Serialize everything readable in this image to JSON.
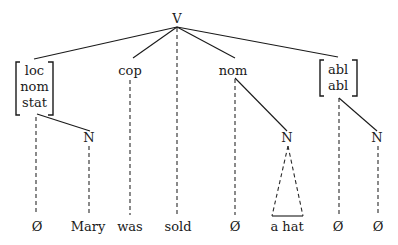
{
  "diagram": {
    "type": "syntax-tree",
    "root": {
      "id": "V",
      "label": "V"
    },
    "nodes": [
      {
        "id": "case1",
        "kind": "feature-bundle",
        "labels": [
          "loc",
          "nom",
          "stat"
        ],
        "parent": "V"
      },
      {
        "id": "cop",
        "kind": "label",
        "labels": [
          "cop"
        ],
        "parent": "V"
      },
      {
        "id": "nom",
        "kind": "label",
        "labels": [
          "nom"
        ],
        "parent": "V"
      },
      {
        "id": "case4",
        "kind": "feature-bundle",
        "labels": [
          "abl",
          "abl"
        ],
        "parent": "V"
      },
      {
        "id": "N1",
        "kind": "label",
        "labels": [
          "N"
        ],
        "parent": "case1"
      },
      {
        "id": "N2",
        "kind": "label",
        "labels": [
          "N"
        ],
        "parent": "nom"
      },
      {
        "id": "N3",
        "kind": "label",
        "labels": [
          "N"
        ],
        "parent": "case4"
      }
    ],
    "terminals": [
      {
        "id": "t1",
        "label": "Ø",
        "parent": "case1",
        "link": "dashed"
      },
      {
        "id": "t2",
        "label": "Mary",
        "parent": "N1",
        "link": "dashed"
      },
      {
        "id": "t3",
        "label": "was",
        "parent": "cop",
        "link": "dashed"
      },
      {
        "id": "t4",
        "label": "sold",
        "parent": "V",
        "link": "dashed"
      },
      {
        "id": "t5",
        "label": "Ø",
        "parent": "nom",
        "link": "dashed"
      },
      {
        "id": "t6",
        "label": "a hat",
        "parent": "N2",
        "link": "triangle"
      },
      {
        "id": "t7",
        "label": "Ø",
        "parent": "case4",
        "link": "dashed"
      },
      {
        "id": "t8",
        "label": "Ø",
        "parent": "N3",
        "link": "dashed"
      }
    ],
    "edges": [
      {
        "from": "V",
        "to": "case1",
        "style": "solid"
      },
      {
        "from": "V",
        "to": "cop",
        "style": "solid"
      },
      {
        "from": "V",
        "to": "nom",
        "style": "solid"
      },
      {
        "from": "V",
        "to": "case4",
        "style": "solid"
      },
      {
        "from": "V",
        "to": "t4",
        "style": "dashed"
      },
      {
        "from": "case1",
        "to": "N1",
        "style": "solid"
      },
      {
        "from": "nom",
        "to": "N2",
        "style": "solid"
      },
      {
        "from": "case4",
        "to": "N3",
        "style": "solid"
      },
      {
        "from": "case1",
        "to": "t1",
        "style": "dashed"
      },
      {
        "from": "N1",
        "to": "t2",
        "style": "dashed"
      },
      {
        "from": "cop",
        "to": "t3",
        "style": "dashed"
      },
      {
        "from": "nom",
        "to": "t5",
        "style": "dashed"
      },
      {
        "from": "N2",
        "to": "t6",
        "style": "triangle"
      },
      {
        "from": "case4",
        "to": "t7",
        "style": "dashed"
      },
      {
        "from": "N3",
        "to": "t8",
        "style": "dashed"
      }
    ]
  },
  "labels": {
    "root": "V",
    "case1": [
      "loc",
      "nom",
      "stat"
    ],
    "cop": "cop",
    "nom": "nom",
    "case4": [
      "abl",
      "abl"
    ],
    "N1": "N",
    "N2": "N",
    "N3": "N",
    "terminals": [
      "Ø",
      "Mary",
      "was",
      "sold",
      "Ø",
      "a hat",
      "Ø",
      "Ø"
    ]
  }
}
